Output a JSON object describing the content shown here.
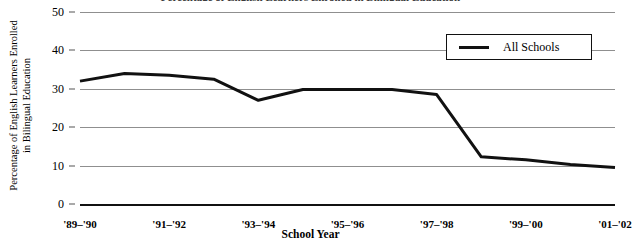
{
  "title_sliver": "Percentage of English Learners Enrolled in Bilingual Education",
  "axes": {
    "ylabel_line1": "Percentage of English Learners Enrolled",
    "ylabel_line2": "in Bilingual Education",
    "xlabel": "School Year"
  },
  "legend": {
    "position": "top-right",
    "entries": [
      {
        "label": "All Schools",
        "color": "#111111",
        "marker": "line-swatch"
      }
    ]
  },
  "chart_data": {
    "type": "line",
    "title": "Percentage of English Learners Enrolled in Bilingual Education",
    "xlabel": "School Year",
    "ylabel": "Percentage of English Learners Enrolled in Bilingual Education",
    "categories": [
      "'89-'90",
      "'90-'91",
      "'91-'92",
      "'92-'93",
      "'93-'94",
      "'94-'95",
      "'95-'96",
      "'96-'97",
      "'97-'98",
      "'98-'99",
      "'99-'00",
      "'00-'01",
      "'01-'02"
    ],
    "xtick_labels": [
      "'89–'90",
      "'91–'92",
      "'93–'94",
      "'95–'96",
      "'97–'98",
      "'99–'00",
      "'01–'02"
    ],
    "xtick_indices": [
      0,
      2,
      4,
      6,
      8,
      10,
      12
    ],
    "ytick_labels": [
      "0",
      "10",
      "20",
      "30",
      "40",
      "50"
    ],
    "yticks": [
      0,
      10,
      20,
      30,
      40,
      50
    ],
    "ylim": [
      0,
      50
    ],
    "grid": "horizontal",
    "series": [
      {
        "name": "All Schools",
        "color": "#111111",
        "values": [
          32.0,
          34.0,
          33.5,
          32.5,
          27.0,
          29.8,
          29.8,
          29.8,
          28.5,
          12.3,
          11.5,
          10.3,
          9.5
        ]
      }
    ]
  }
}
